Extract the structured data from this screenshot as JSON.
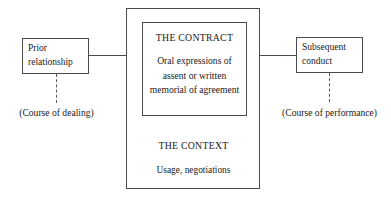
{
  "diagram": {
    "line_color": "#4a4a4a",
    "dashed_color": "#5a5a5a",
    "background": "#ffffff",
    "outer_box": {
      "heading": "THE CONTEXT",
      "body": "Usage, negotiations"
    },
    "inner_box": {
      "heading": "THE CONTRACT",
      "body": "Oral expressions of assent or written memorial of agreement"
    },
    "left_node": {
      "label": "Prior relationship",
      "caption": "(Course of dealing)"
    },
    "right_node": {
      "label": "Subsequent conduct",
      "caption": "(Course of performance)"
    }
  }
}
